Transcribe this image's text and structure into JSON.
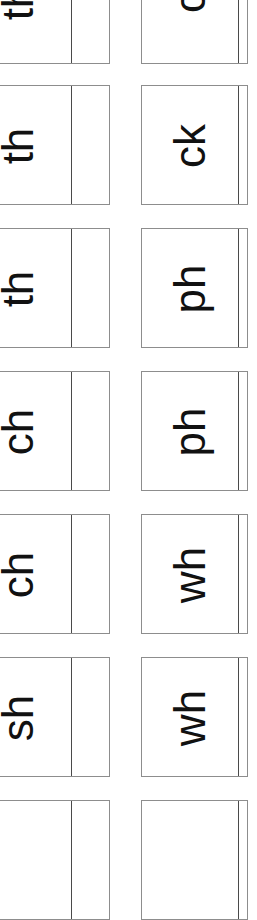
{
  "document": {
    "title": "Phonics digraph flashcard sheet",
    "description": "Printed sheet of cut-apart phonics digraph flashcards, arranged in two columns, text printed rotated 90 degrees counter-clockwise.",
    "page_background": "#ffffff",
    "ink_color": "#111111",
    "card_border_color": "#8d8d8d",
    "card_inner_rule_color": "#4a4a4a"
  },
  "layout": {
    "columns": 2,
    "rows": 7,
    "column_labels": [
      "left-column",
      "right-column"
    ],
    "text_rotation_degrees": -90,
    "row_pitch_px": 143,
    "card_height_px": 120
  },
  "cards": [
    {
      "row": 1,
      "column": "left",
      "label": "th",
      "clipped": "top-and-left"
    },
    {
      "row": 1,
      "column": "right",
      "label": "c",
      "clipped": "top"
    },
    {
      "row": 2,
      "column": "left",
      "label": "th",
      "clipped": "left"
    },
    {
      "row": 2,
      "column": "right",
      "label": "ck",
      "clipped": "none"
    },
    {
      "row": 3,
      "column": "left",
      "label": "th",
      "clipped": "left"
    },
    {
      "row": 3,
      "column": "right",
      "label": "ph",
      "clipped": "none"
    },
    {
      "row": 4,
      "column": "left",
      "label": "ch",
      "clipped": "left"
    },
    {
      "row": 4,
      "column": "right",
      "label": "ph",
      "clipped": "none"
    },
    {
      "row": 5,
      "column": "left",
      "label": "ch",
      "clipped": "left"
    },
    {
      "row": 5,
      "column": "right",
      "label": "wh",
      "clipped": "none"
    },
    {
      "row": 6,
      "column": "left",
      "label": "sh",
      "clipped": "left"
    },
    {
      "row": 6,
      "column": "right",
      "label": "wh",
      "clipped": "none"
    },
    {
      "row": 7,
      "column": "left",
      "label": "",
      "clipped": "bottom-and-left"
    },
    {
      "row": 7,
      "column": "right",
      "label": "",
      "clipped": "bottom"
    }
  ]
}
